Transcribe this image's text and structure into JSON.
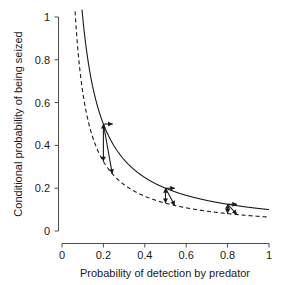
{
  "chart_data": {
    "type": "line",
    "title": "",
    "xlabel": "Probability of detection by predator",
    "ylabel": "Conditional probability of being seized",
    "xlim": [
      0,
      1
    ],
    "ylim": [
      0,
      1
    ],
    "grid": false,
    "legend": "none",
    "xticks": [
      "0",
      "0.2",
      "0.4",
      "0.6",
      "0.8",
      "1"
    ],
    "xtick_values": [
      0,
      0.2,
      0.4,
      0.6,
      0.8,
      1
    ],
    "yticks": [
      "0",
      "0.2",
      "0.4",
      "0.6",
      "0.8",
      "1"
    ],
    "ytick_values": [
      0,
      0.2,
      0.4,
      0.6,
      0.8,
      1
    ],
    "series": [
      {
        "name": "upper-curve-solid",
        "style": "solid",
        "color": "#1a1a1a",
        "formula": "y = 0.10 / x",
        "x": [
          0.1,
          0.12,
          0.14,
          0.16,
          0.18,
          0.2,
          0.25,
          0.3,
          0.35,
          0.4,
          0.45,
          0.5,
          0.55,
          0.6,
          0.65,
          0.7,
          0.75,
          0.8,
          0.85,
          0.9,
          0.95,
          1.0
        ],
        "values": [
          1.0,
          0.833,
          0.714,
          0.625,
          0.556,
          0.5,
          0.4,
          0.333,
          0.286,
          0.25,
          0.222,
          0.2,
          0.182,
          0.167,
          0.154,
          0.143,
          0.133,
          0.125,
          0.118,
          0.111,
          0.105,
          0.1
        ]
      },
      {
        "name": "lower-curve-dashed",
        "style": "dashed",
        "color": "#1a1a1a",
        "formula": "y = 0.065 / x",
        "x": [
          0.065,
          0.08,
          0.1,
          0.12,
          0.14,
          0.16,
          0.18,
          0.2,
          0.25,
          0.3,
          0.35,
          0.4,
          0.45,
          0.5,
          0.55,
          0.6,
          0.65,
          0.7,
          0.75,
          0.8,
          0.85,
          0.9,
          0.95,
          1.0
        ],
        "values": [
          1.0,
          0.813,
          0.65,
          0.542,
          0.464,
          0.406,
          0.361,
          0.325,
          0.26,
          0.217,
          0.186,
          0.163,
          0.144,
          0.13,
          0.118,
          0.108,
          0.1,
          0.093,
          0.087,
          0.081,
          0.076,
          0.072,
          0.068,
          0.065
        ]
      }
    ],
    "annotations": [
      {
        "name": "annotation-cluster-1",
        "x": 0.2,
        "vertical_arrow": {
          "from": [
            0.2,
            0.325
          ],
          "to": [
            0.2,
            0.5
          ],
          "double_headed": true
        },
        "horizontal_arrow": {
          "from": [
            0.2,
            0.5
          ],
          "to": [
            0.245,
            0.5
          ]
        },
        "diagonal_arrow": {
          "from": [
            0.2,
            0.5
          ],
          "to": [
            0.243,
            0.267
          ]
        }
      },
      {
        "name": "annotation-cluster-2",
        "x": 0.5,
        "vertical_arrow": {
          "from": [
            0.5,
            0.13
          ],
          "to": [
            0.5,
            0.2
          ],
          "double_headed": true
        },
        "horizontal_arrow": {
          "from": [
            0.5,
            0.2
          ],
          "to": [
            0.545,
            0.2
          ]
        },
        "diagonal_arrow": {
          "from": [
            0.5,
            0.2
          ],
          "to": [
            0.545,
            0.119
          ]
        }
      },
      {
        "name": "annotation-cluster-3",
        "x": 0.8,
        "vertical_arrow": {
          "from": [
            0.8,
            0.081
          ],
          "to": [
            0.8,
            0.125
          ],
          "double_headed": true
        },
        "horizontal_arrow": {
          "from": [
            0.8,
            0.125
          ],
          "to": [
            0.845,
            0.125
          ]
        },
        "diagonal_arrow": {
          "from": [
            0.8,
            0.125
          ],
          "to": [
            0.845,
            0.077
          ]
        }
      }
    ]
  }
}
